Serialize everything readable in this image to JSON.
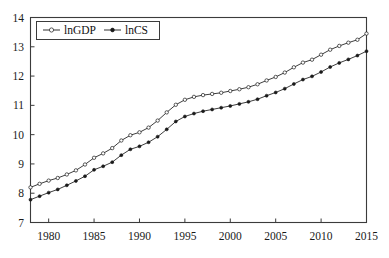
{
  "chart_data": {
    "type": "line",
    "title": "",
    "subtitle": "",
    "xlabel": "",
    "ylabel": "",
    "xlim": [
      1978,
      2015
    ],
    "ylim": [
      7,
      14
    ],
    "grid": false,
    "legend_position": "top-left",
    "x_ticks": [
      "1980",
      "1985",
      "1990",
      "1995",
      "2000",
      "2005",
      "2010",
      "2015"
    ],
    "x_tick_values": [
      1980,
      1985,
      1990,
      1995,
      2000,
      2005,
      2010,
      2015
    ],
    "y_ticks": [
      "7",
      "8",
      "9",
      "10",
      "11",
      "12",
      "13",
      "14"
    ],
    "y_tick_values": [
      7,
      8,
      9,
      10,
      11,
      12,
      13,
      14
    ],
    "x": [
      1978,
      1979,
      1980,
      1981,
      1982,
      1983,
      1984,
      1985,
      1986,
      1987,
      1988,
      1989,
      1990,
      1991,
      1992,
      1993,
      1994,
      1995,
      1996,
      1997,
      1998,
      1999,
      2000,
      2001,
      2002,
      2003,
      2004,
      2005,
      2006,
      2007,
      2008,
      2009,
      2010,
      2011,
      2012,
      2013,
      2014,
      2015
    ],
    "series": [
      {
        "name": "lnGDP",
        "marker": "open-circle",
        "values": [
          8.2,
          8.32,
          8.43,
          8.52,
          8.64,
          8.78,
          8.98,
          9.21,
          9.36,
          9.54,
          9.8,
          9.98,
          10.08,
          10.24,
          10.48,
          10.76,
          11.02,
          11.19,
          11.29,
          11.35,
          11.39,
          11.43,
          11.49,
          11.55,
          11.62,
          11.72,
          11.85,
          11.97,
          12.12,
          12.3,
          12.46,
          12.56,
          12.73,
          12.9,
          13.03,
          13.14,
          13.24,
          13.45
        ]
      },
      {
        "name": "lnCS",
        "marker": "filled-circle",
        "values": [
          7.78,
          7.9,
          8.02,
          8.13,
          8.27,
          8.42,
          8.58,
          8.8,
          8.92,
          9.06,
          9.3,
          9.5,
          9.6,
          9.74,
          9.93,
          10.18,
          10.45,
          10.62,
          10.72,
          10.8,
          10.86,
          10.92,
          10.98,
          11.05,
          11.12,
          11.21,
          11.33,
          11.44,
          11.57,
          11.73,
          11.88,
          11.99,
          12.14,
          12.31,
          12.45,
          12.57,
          12.7,
          12.85
        ]
      }
    ],
    "legend": [
      {
        "label": "lnGDP",
        "marker": "open-circle"
      },
      {
        "label": "lnCS",
        "marker": "filled-circle"
      }
    ]
  },
  "colors": {
    "background": "#ffffff",
    "axis": "#3b3b3b",
    "line": "#1a1a1a",
    "text": "#1a1a1a"
  }
}
